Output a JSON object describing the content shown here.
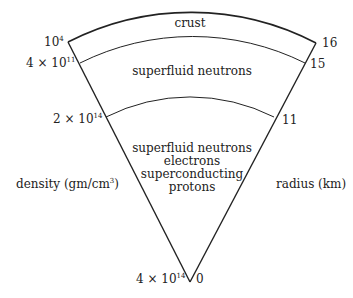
{
  "regions": [
    {
      "lines": [
        "crust"
      ]
    },
    {
      "lines": [
        "superfluid neutrons"
      ]
    },
    {
      "lines": [
        "superfluid neutrons",
        "electrons",
        "superconducting",
        "protons"
      ]
    }
  ],
  "density_labels": [
    {
      "base": "10",
      "exp": "4"
    },
    {
      "base": "4 × 10",
      "exp": "11"
    },
    {
      "base": "2 × 10",
      "exp": "14"
    },
    {
      "base": "4 × 10",
      "exp": "14"
    }
  ],
  "radius_labels": [
    "16",
    "15",
    "11",
    "0"
  ],
  "axis_labels": {
    "density": "density (gm/cm",
    "density_exp": "3",
    "density_close": ")",
    "radius": "radius (km)"
  }
}
